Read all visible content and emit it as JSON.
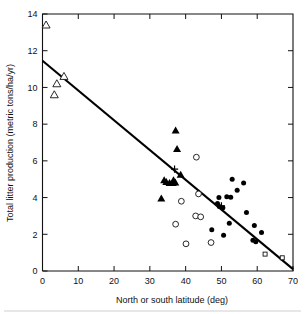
{
  "chart_data": {
    "type": "scatter",
    "title": "",
    "subtitle": "",
    "xlabel": "North or south latitude   (deg)",
    "ylabel": "Total litter production   (metric tons/ha/yr)",
    "xlim": [
      0,
      70
    ],
    "ylim": [
      0,
      14
    ],
    "xticks": [
      0,
      10,
      20,
      30,
      40,
      50,
      60,
      70
    ],
    "yticks": [
      0,
      2,
      4,
      6,
      8,
      10,
      12,
      14
    ],
    "xtick_labels": [
      "0",
      "10",
      "20",
      "30",
      "40",
      "50",
      "60",
      "70"
    ],
    "ytick_labels": [
      "0",
      "2",
      "4",
      "6",
      "8",
      "10",
      "12",
      "14"
    ],
    "grid": false,
    "legend": "none",
    "legend_position": "none",
    "annotations": [],
    "trend_line": {
      "name": "regression line",
      "x": [
        0,
        70
      ],
      "y": [
        11.45,
        0.1
      ],
      "color": "#000000"
    },
    "series": [
      {
        "name": "open-triangle",
        "marker": "triangle-open",
        "color": "#111111",
        "points": [
          {
            "x": 1.0,
            "y": 13.4
          },
          {
            "x": 6.0,
            "y": 10.6
          },
          {
            "x": 4.0,
            "y": 10.2
          },
          {
            "x": 3.3,
            "y": 9.6
          }
        ]
      },
      {
        "name": "filled-triangle",
        "marker": "triangle-filled",
        "color": "#000000",
        "points": [
          {
            "x": 37.2,
            "y": 7.65
          },
          {
            "x": 37.6,
            "y": 6.65
          },
          {
            "x": 38.6,
            "y": 5.25
          },
          {
            "x": 34.0,
            "y": 4.95
          },
          {
            "x": 34.6,
            "y": 4.85
          },
          {
            "x": 35.5,
            "y": 4.8
          },
          {
            "x": 36.4,
            "y": 4.8
          },
          {
            "x": 37.1,
            "y": 4.82
          },
          {
            "x": 36.6,
            "y": 4.95
          },
          {
            "x": 33.2,
            "y": 3.95
          }
        ]
      },
      {
        "name": "open-circle",
        "marker": "circle-open",
        "color": "#111111",
        "points": [
          {
            "x": 43.0,
            "y": 6.2
          },
          {
            "x": 43.6,
            "y": 4.2
          },
          {
            "x": 38.8,
            "y": 3.8
          },
          {
            "x": 42.8,
            "y": 3.0
          },
          {
            "x": 37.2,
            "y": 2.55
          },
          {
            "x": 44.2,
            "y": 2.95
          },
          {
            "x": 40.1,
            "y": 1.48
          },
          {
            "x": 47.1,
            "y": 1.55
          }
        ]
      },
      {
        "name": "filled-circle",
        "marker": "circle-filled",
        "color": "#000000",
        "points": [
          {
            "x": 53.0,
            "y": 5.0
          },
          {
            "x": 56.2,
            "y": 4.8
          },
          {
            "x": 54.4,
            "y": 4.4
          },
          {
            "x": 51.5,
            "y": 4.05
          },
          {
            "x": 52.6,
            "y": 4.02
          },
          {
            "x": 49.3,
            "y": 4.0
          },
          {
            "x": 48.9,
            "y": 3.68
          },
          {
            "x": 49.4,
            "y": 3.52
          },
          {
            "x": 50.4,
            "y": 3.45
          },
          {
            "x": 57.0,
            "y": 3.18
          },
          {
            "x": 52.2,
            "y": 2.6
          },
          {
            "x": 59.2,
            "y": 2.48
          },
          {
            "x": 61.2,
            "y": 2.1
          },
          {
            "x": 47.3,
            "y": 2.25
          },
          {
            "x": 50.6,
            "y": 1.95
          },
          {
            "x": 58.8,
            "y": 1.68
          },
          {
            "x": 59.6,
            "y": 1.6
          }
        ]
      },
      {
        "name": "open-square",
        "marker": "square-open",
        "color": "#111111",
        "points": [
          {
            "x": 62.2,
            "y": 0.92
          },
          {
            "x": 67.0,
            "y": 0.72
          }
        ]
      },
      {
        "name": "plus",
        "marker": "plus",
        "color": "#000000",
        "points": [
          {
            "x": 36.9,
            "y": 5.55
          },
          {
            "x": 50.0,
            "y": 3.55
          }
        ]
      }
    ]
  }
}
